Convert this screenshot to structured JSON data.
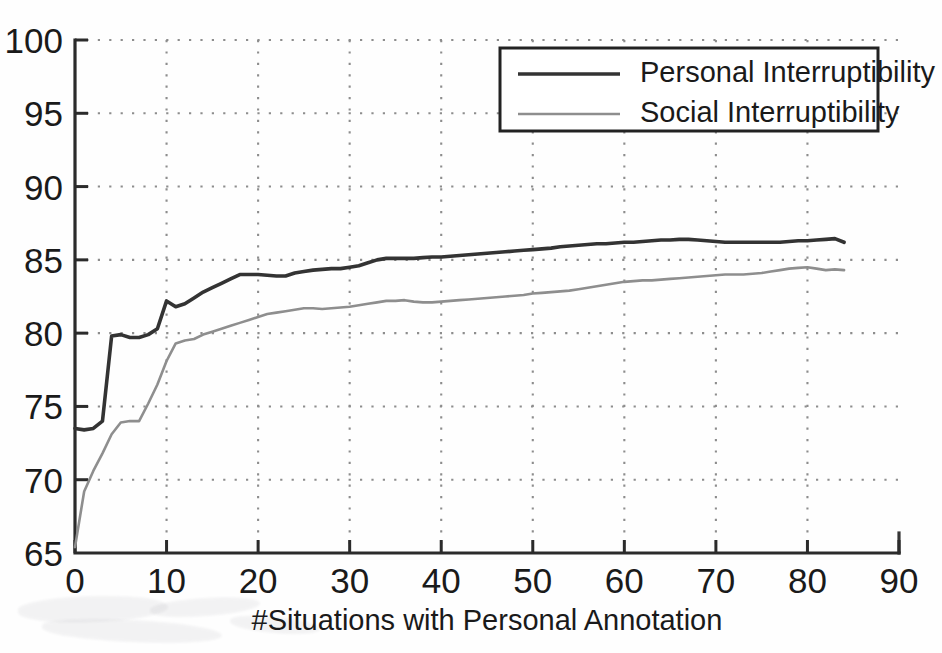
{
  "chart_data": {
    "type": "line",
    "title": "",
    "xlabel": "#Situations with Personal Annotation",
    "ylabel": "",
    "xlim": [
      0,
      90
    ],
    "ylim": [
      65,
      100
    ],
    "xticks": [
      0,
      10,
      20,
      30,
      40,
      50,
      60,
      70,
      80,
      90
    ],
    "yticks": [
      65,
      70,
      75,
      80,
      85,
      90,
      95,
      100
    ],
    "grid": true,
    "legend_position": "top-right",
    "series": [
      {
        "name": "Personal Interruptibility",
        "color": "#333333",
        "x": [
          0,
          1,
          2,
          3,
          4,
          5,
          6,
          7,
          8,
          9,
          10,
          11,
          12,
          13,
          14,
          15,
          16,
          17,
          18,
          19,
          20,
          21,
          22,
          23,
          24,
          25,
          26,
          27,
          28,
          29,
          30,
          31,
          32,
          33,
          34,
          35,
          36,
          37,
          38,
          39,
          40,
          41,
          42,
          43,
          44,
          45,
          46,
          47,
          48,
          49,
          50,
          51,
          52,
          53,
          54,
          55,
          56,
          57,
          58,
          59,
          60,
          61,
          62,
          63,
          64,
          65,
          66,
          67,
          68,
          69,
          70,
          71,
          72,
          73,
          74,
          75,
          76,
          77,
          78,
          79,
          80,
          81,
          82,
          83,
          84
        ],
        "values": [
          73.5,
          73.4,
          73.5,
          74.0,
          79.8,
          79.9,
          79.7,
          79.7,
          79.9,
          80.3,
          82.2,
          81.8,
          82.0,
          82.4,
          82.8,
          83.1,
          83.4,
          83.7,
          84.0,
          84.0,
          84.0,
          83.95,
          83.9,
          83.9,
          84.1,
          84.2,
          84.3,
          84.35,
          84.4,
          84.4,
          84.5,
          84.6,
          84.8,
          85.0,
          85.1,
          85.1,
          85.1,
          85.1,
          85.15,
          85.2,
          85.2,
          85.25,
          85.3,
          85.35,
          85.4,
          85.45,
          85.5,
          85.55,
          85.6,
          85.65,
          85.7,
          85.75,
          85.8,
          85.9,
          85.95,
          86.0,
          86.05,
          86.1,
          86.1,
          86.15,
          86.2,
          86.2,
          86.25,
          86.3,
          86.35,
          86.35,
          86.4,
          86.4,
          86.35,
          86.3,
          86.25,
          86.2,
          86.2,
          86.2,
          86.2,
          86.2,
          86.2,
          86.2,
          86.25,
          86.3,
          86.3,
          86.35,
          86.4,
          86.45,
          86.2
        ]
      },
      {
        "name": "Social Interruptibility",
        "color": "#8e8e8e",
        "x": [
          0,
          1,
          2,
          3,
          4,
          5,
          6,
          7,
          8,
          9,
          10,
          11,
          12,
          13,
          14,
          15,
          16,
          17,
          18,
          19,
          20,
          21,
          22,
          23,
          24,
          25,
          26,
          27,
          28,
          29,
          30,
          31,
          32,
          33,
          34,
          35,
          36,
          37,
          38,
          39,
          40,
          41,
          42,
          43,
          44,
          45,
          46,
          47,
          48,
          49,
          50,
          51,
          52,
          53,
          54,
          55,
          56,
          57,
          58,
          59,
          60,
          61,
          62,
          63,
          64,
          65,
          66,
          67,
          68,
          69,
          70,
          71,
          72,
          73,
          74,
          75,
          76,
          77,
          78,
          79,
          80,
          81,
          82,
          83,
          84
        ],
        "values": [
          65.4,
          69.2,
          70.6,
          71.8,
          73.1,
          73.9,
          74.0,
          74.0,
          75.2,
          76.5,
          78.1,
          79.3,
          79.5,
          79.6,
          79.9,
          80.1,
          80.3,
          80.5,
          80.7,
          80.9,
          81.1,
          81.3,
          81.4,
          81.5,
          81.6,
          81.7,
          81.7,
          81.65,
          81.7,
          81.75,
          81.8,
          81.9,
          82.0,
          82.1,
          82.2,
          82.2,
          82.25,
          82.15,
          82.1,
          82.1,
          82.15,
          82.2,
          82.25,
          82.3,
          82.35,
          82.4,
          82.45,
          82.5,
          82.55,
          82.6,
          82.7,
          82.75,
          82.8,
          82.85,
          82.9,
          83.0,
          83.1,
          83.2,
          83.3,
          83.4,
          83.5,
          83.55,
          83.6,
          83.6,
          83.65,
          83.7,
          83.75,
          83.8,
          83.85,
          83.9,
          83.95,
          84.0,
          84.0,
          84.0,
          84.05,
          84.1,
          84.2,
          84.3,
          84.4,
          84.45,
          84.5,
          84.4,
          84.3,
          84.35,
          84.3
        ]
      }
    ]
  },
  "axis": {
    "x_tick_labels": [
      "0",
      "10",
      "20",
      "30",
      "40",
      "50",
      "60",
      "70",
      "80",
      "90"
    ],
    "y_tick_labels": [
      "65",
      "70",
      "75",
      "80",
      "85",
      "90",
      "95",
      "100"
    ],
    "x_title": "#Situations with Personal Annotation"
  },
  "legend": {
    "entries": [
      {
        "label": "Personal Interruptibility",
        "color": "#333333"
      },
      {
        "label": "Social Interruptibility",
        "color": "#8e8e8e"
      }
    ]
  }
}
